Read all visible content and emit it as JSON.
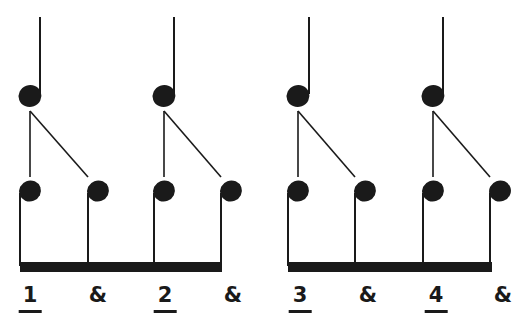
{
  "diagram": {
    "type": "rhythm-subdivision",
    "ink_color": "#1a1a1a",
    "background": "#ffffff",
    "groups": [
      {
        "quarter": {
          "head_x": 30,
          "stem_x": 40
        },
        "eighths": [
          {
            "x": 30
          },
          {
            "x": 98
          }
        ],
        "beat": 1
      },
      {
        "quarter": {
          "head_x": 164,
          "stem_x": 174
        },
        "eighths": [
          {
            "x": 164
          },
          {
            "x": 231
          }
        ],
        "beat": 2
      },
      {
        "quarter": {
          "head_x": 298,
          "stem_x": 309
        },
        "eighths": [
          {
            "x": 298
          },
          {
            "x": 365
          }
        ],
        "beat": 3
      },
      {
        "quarter": {
          "head_x": 433,
          "stem_x": 443
        },
        "eighths": [
          {
            "x": 433
          },
          {
            "x": 500
          }
        ],
        "beat": 4
      }
    ],
    "beams": [
      {
        "x1": 20,
        "x2": 222
      },
      {
        "x1": 288,
        "x2": 492
      }
    ],
    "labels": [
      {
        "text": "1",
        "x": 30,
        "underlined": true
      },
      {
        "text": "&",
        "x": 98,
        "underlined": false
      },
      {
        "text": "2",
        "x": 165,
        "underlined": true
      },
      {
        "text": "&",
        "x": 233,
        "underlined": false
      },
      {
        "text": "3",
        "x": 300,
        "underlined": true
      },
      {
        "text": "&",
        "x": 368,
        "underlined": false
      },
      {
        "text": "4",
        "x": 436,
        "underlined": true
      },
      {
        "text": "&",
        "x": 503,
        "underlined": false
      }
    ]
  }
}
